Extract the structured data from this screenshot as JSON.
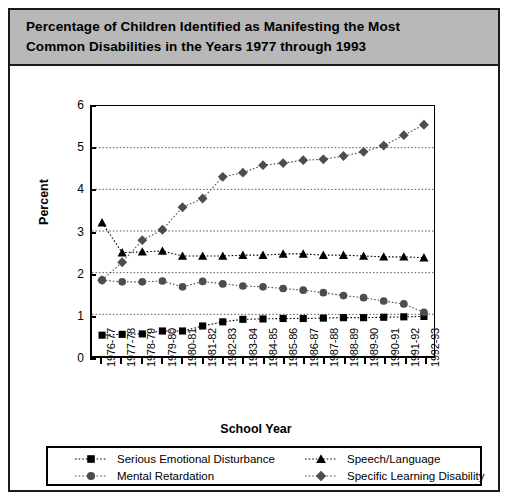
{
  "title": "Percentage of Children Identified as Manifesting the Most Common Disabilities in the Years 1977 through 1993",
  "title_line1": "Percentage of Children Identified as Manifesting the Most",
  "title_line2": "Common Disabilities in the Years 1977 through 1993",
  "colors": {
    "banner": "#b8b8b8",
    "frame": "#1a1a1a",
    "series_square": "#000000",
    "series_triangle": "#000000",
    "series_circle": "#4d4d4d",
    "series_diamond": "#4d4d4d",
    "gridline": "#555555"
  },
  "chart_data": {
    "type": "line",
    "title": "Percentage of Children Identified as Manifesting the Most Common Disabilities in the Years 1977 through 1993",
    "xlabel": "School Year",
    "ylabel": "Percent",
    "ylim": [
      0,
      6
    ],
    "yticks": [
      0,
      1,
      2,
      3,
      4,
      5,
      6
    ],
    "grid": true,
    "legend_position": "bottom",
    "categories": [
      "1976-77",
      "1977-78",
      "1978-79",
      "1979-80",
      "1980-81",
      "1981-82",
      "1982-83",
      "1983-84",
      "1984-85",
      "1985-86",
      "1986-87",
      "1987-88",
      "1988-89",
      "1989-90",
      "1990-91",
      "1991-92",
      "1992-93"
    ],
    "series": [
      {
        "name": "Serious Emotional Disturbance",
        "marker": "square",
        "color": "#000000",
        "values": [
          0.5,
          0.52,
          0.53,
          0.6,
          0.6,
          0.72,
          0.82,
          0.88,
          0.89,
          0.9,
          0.9,
          0.91,
          0.92,
          0.92,
          0.93,
          0.94,
          0.95
        ]
      },
      {
        "name": "Mental Retardation",
        "marker": "circle",
        "color": "#4d4d4d",
        "values": [
          1.82,
          1.78,
          1.78,
          1.8,
          1.66,
          1.79,
          1.73,
          1.68,
          1.66,
          1.62,
          1.58,
          1.52,
          1.45,
          1.4,
          1.32,
          1.25,
          1.05
        ]
      },
      {
        "name": "Speech/Language",
        "marker": "triangle",
        "color": "#000000",
        "values": [
          3.2,
          2.48,
          2.5,
          2.52,
          2.4,
          2.4,
          2.4,
          2.42,
          2.42,
          2.45,
          2.45,
          2.42,
          2.42,
          2.4,
          2.38,
          2.38,
          2.36
        ]
      },
      {
        "name": "Specific Learning Disability",
        "marker": "diamond",
        "color": "#4d4d4d",
        "values": [
          1.82,
          2.25,
          2.78,
          3.03,
          3.57,
          3.78,
          4.3,
          4.4,
          4.58,
          4.63,
          4.7,
          4.72,
          4.8,
          4.9,
          5.05,
          5.3,
          5.55
        ]
      }
    ]
  },
  "legend": {
    "entries": [
      {
        "label": "Serious Emotional Disturbance",
        "marker": "square",
        "color": "#000000"
      },
      {
        "label": "Speech/Language",
        "marker": "triangle",
        "color": "#000000"
      },
      {
        "label": "Mental Retardation",
        "marker": "circle",
        "color": "#4d4d4d"
      },
      {
        "label": "Specific Learning Disability",
        "marker": "diamond",
        "color": "#4d4d4d"
      }
    ]
  }
}
